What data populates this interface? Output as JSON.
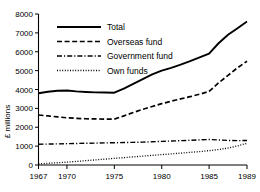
{
  "chart_data": {
    "type": "line",
    "title": "",
    "xlabel": "",
    "ylabel": "£ millions",
    "xlim": [
      1967,
      1989
    ],
    "ylim": [
      0,
      8000
    ],
    "grid": false,
    "legend_position": "top-left",
    "x": [
      1967,
      1968,
      1969,
      1970,
      1971,
      1972,
      1973,
      1974,
      1975,
      1976,
      1977,
      1978,
      1979,
      1980,
      1981,
      1982,
      1983,
      1984,
      1985,
      1986,
      1987,
      1988,
      1989
    ],
    "xticks": [
      "1967",
      "1970",
      "1975",
      "1980",
      "1985",
      "1989"
    ],
    "xtick_values": [
      1967,
      1970,
      1975,
      1980,
      1985,
      1989
    ],
    "yticks": [
      "0",
      "1000",
      "2000",
      "3000",
      "4000",
      "5000",
      "6000",
      "7000",
      "8000"
    ],
    "ytick_values": [
      0,
      1000,
      2000,
      3000,
      4000,
      5000,
      6000,
      7000,
      8000
    ],
    "series": [
      {
        "name": "Total",
        "style": "solid",
        "values": [
          3800,
          3880,
          3930,
          3950,
          3900,
          3870,
          3850,
          3840,
          3830,
          4050,
          4300,
          4550,
          4800,
          5000,
          5150,
          5320,
          5500,
          5700,
          5900,
          6450,
          6900,
          7250,
          7600
        ]
      },
      {
        "name": "Overseas fund",
        "style": "dashed",
        "values": [
          2650,
          2600,
          2550,
          2500,
          2470,
          2450,
          2440,
          2430,
          2430,
          2600,
          2780,
          2950,
          3100,
          3250,
          3380,
          3500,
          3620,
          3750,
          3900,
          4350,
          4750,
          5150,
          5500
        ]
      },
      {
        "name": "Government fund",
        "style": "dashdot",
        "values": [
          1100,
          1110,
          1120,
          1130,
          1140,
          1150,
          1160,
          1170,
          1180,
          1190,
          1200,
          1210,
          1230,
          1250,
          1270,
          1290,
          1310,
          1330,
          1350,
          1330,
          1300,
          1290,
          1300
        ]
      },
      {
        "name": "Own funds",
        "style": "dotted",
        "values": [
          60,
          90,
          120,
          150,
          190,
          230,
          270,
          310,
          350,
          390,
          430,
          470,
          510,
          550,
          590,
          630,
          670,
          710,
          760,
          820,
          900,
          1010,
          1150
        ]
      }
    ]
  },
  "legend": {
    "items": [
      {
        "label": "Total",
        "style": "solid"
      },
      {
        "label": "Overseas fund",
        "style": "dashed"
      },
      {
        "label": "Government fund",
        "style": "dashdot"
      },
      {
        "label": "Own funds",
        "style": "dotted"
      }
    ]
  },
  "colors": {
    "ink": "#000000",
    "background": "#ffffff"
  }
}
